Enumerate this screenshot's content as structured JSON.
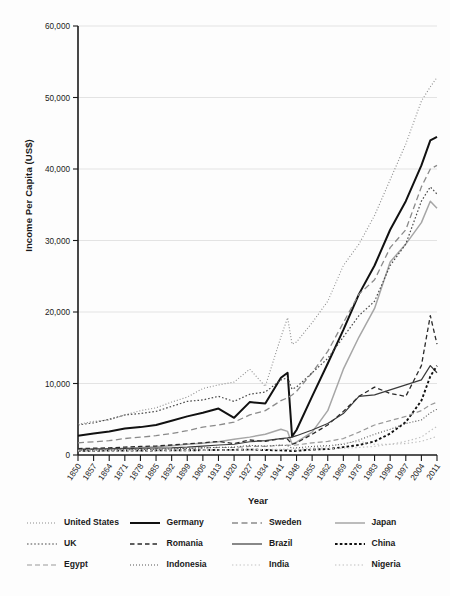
{
  "chart_data": {
    "type": "line",
    "title": "",
    "xlabel": "Year",
    "ylabel": "Income Per Capita (US$)",
    "xlim": [
      1850,
      2011
    ],
    "ylim": [
      0,
      60000
    ],
    "grid": true,
    "legend_position": "bottom",
    "ytick_labels": [
      "0",
      "10,000",
      "20,000",
      "30,000",
      "40,000",
      "50,000",
      "60,000"
    ],
    "ytick_values": [
      0,
      10000,
      20000,
      30000,
      40000,
      50000,
      60000
    ],
    "xtick_labels": [
      "1850",
      "1857",
      "1864",
      "1871",
      "1878",
      "1885",
      "1892",
      "1899",
      "1906",
      "1913",
      "1920",
      "1927",
      "1934",
      "1941",
      "1948",
      "1955",
      "1962",
      "1969",
      "1976",
      "1983",
      "1990",
      "1997",
      "2004",
      "2011"
    ],
    "xtick_values": [
      1850,
      1857,
      1864,
      1871,
      1878,
      1885,
      1892,
      1899,
      1906,
      1913,
      1920,
      1927,
      1934,
      1941,
      1948,
      1955,
      1962,
      1969,
      1976,
      1983,
      1990,
      1997,
      2004,
      2011
    ],
    "x": [
      1850,
      1857,
      1864,
      1871,
      1878,
      1885,
      1892,
      1899,
      1906,
      1913,
      1920,
      1927,
      1934,
      1941,
      1944,
      1946,
      1948,
      1955,
      1962,
      1969,
      1976,
      1983,
      1990,
      1997,
      2004,
      2008,
      2011
    ],
    "series": [
      {
        "name": "United States",
        "style": "dotted-fine",
        "color": "#8c8c8c",
        "width": 1.1,
        "values": [
          4300,
          4700,
          4900,
          5600,
          6200,
          6600,
          7400,
          8100,
          9300,
          9800,
          10200,
          12000,
          9600,
          16500,
          19200,
          15500,
          15800,
          18500,
          21500,
          26500,
          29500,
          33500,
          38500,
          43500,
          49500,
          51500,
          52800
        ]
      },
      {
        "name": "Germany",
        "style": "solid-thick",
        "color": "#111111",
        "width": 2.0,
        "values": [
          2700,
          3000,
          3300,
          3700,
          3900,
          4200,
          4800,
          5400,
          5900,
          6500,
          5200,
          7400,
          7200,
          10800,
          11500,
          2600,
          3500,
          8200,
          12800,
          17500,
          22500,
          26500,
          31500,
          35500,
          40500,
          44000,
          44500
        ]
      },
      {
        "name": "Sweden",
        "style": "dashed-gray",
        "color": "#8a8a8a",
        "width": 1.3,
        "values": [
          1700,
          1850,
          2000,
          2300,
          2500,
          2700,
          3000,
          3400,
          3900,
          4200,
          4600,
          5600,
          6200,
          7600,
          8000,
          8400,
          8900,
          11500,
          14500,
          18500,
          22500,
          24500,
          29000,
          31500,
          37500,
          40000,
          40500
        ]
      },
      {
        "name": "Japan",
        "style": "solid-gray",
        "color": "#a6a6a6",
        "width": 1.5,
        "values": [
          800,
          830,
          880,
          950,
          1050,
          1150,
          1300,
          1500,
          1650,
          1850,
          2200,
          2500,
          2900,
          3600,
          3300,
          1500,
          1800,
          3200,
          6200,
          12000,
          16500,
          20500,
          27000,
          29500,
          32500,
          35500,
          34500
        ]
      },
      {
        "name": "UK",
        "style": "dotted-med",
        "color": "#4a4a4a",
        "width": 1.2,
        "values": [
          4200,
          4500,
          5000,
          5600,
          5800,
          6100,
          6800,
          7500,
          7700,
          8200,
          7500,
          8500,
          8800,
          10500,
          10800,
          9200,
          9500,
          11500,
          13500,
          16500,
          19500,
          21500,
          26500,
          29500,
          35500,
          37500,
          36500
        ]
      },
      {
        "name": "Romania",
        "style": "dashed-dark",
        "color": "#2a2a2a",
        "width": 1.3,
        "values": [
          900,
          950,
          1000,
          1100,
          1200,
          1250,
          1400,
          1550,
          1700,
          1900,
          1600,
          2100,
          1900,
          2300,
          2200,
          1500,
          1700,
          2900,
          4200,
          6100,
          8200,
          9500,
          8600,
          8200,
          12500,
          19500,
          15500
        ]
      },
      {
        "name": "Brazil",
        "style": "solid-thin",
        "color": "#3a3a3a",
        "width": 1.2,
        "values": [
          800,
          820,
          850,
          880,
          920,
          960,
          1000,
          1100,
          1250,
          1400,
          1500,
          1850,
          2000,
          2300,
          2400,
          2500,
          2700,
          3500,
          4400,
          5800,
          8200,
          8400,
          9100,
          9800,
          10500,
          12500,
          11500
        ]
      },
      {
        "name": "China",
        "style": "dotted-bold",
        "color": "#111111",
        "width": 1.9,
        "values": [
          600,
          600,
          610,
          620,
          630,
          640,
          650,
          660,
          680,
          700,
          720,
          760,
          700,
          640,
          620,
          560,
          580,
          760,
          830,
          1100,
          1400,
          1900,
          3000,
          4600,
          7600,
          11000,
          12500
        ]
      },
      {
        "name": "Egypt",
        "style": "dashdot-gray",
        "color": "#9a9a9a",
        "width": 1.2,
        "values": [
          700,
          720,
          740,
          780,
          820,
          860,
          900,
          950,
          1000,
          1050,
          1050,
          1200,
          1200,
          1350,
          1400,
          1350,
          1400,
          1700,
          1900,
          2300,
          3200,
          4200,
          4800,
          5400,
          6200,
          7000,
          7400
        ]
      },
      {
        "name": "Indonesia",
        "style": "dotted-fine",
        "color": "#555555",
        "width": 1.1,
        "values": [
          680,
          690,
          700,
          730,
          760,
          800,
          850,
          920,
          1000,
          1080,
          1100,
          1350,
          1250,
          1400,
          1300,
          950,
          1000,
          1200,
          1300,
          1500,
          2100,
          2900,
          3600,
          4400,
          4900,
          5900,
          6400
        ]
      },
      {
        "name": "India",
        "style": "dotted-light",
        "color": "#c2c2c2",
        "width": 1.2,
        "values": [
          620,
          620,
          630,
          640,
          650,
          660,
          680,
          700,
          710,
          720,
          700,
          780,
          800,
          800,
          780,
          700,
          720,
          800,
          880,
          950,
          1050,
          1200,
          1500,
          1900,
          2500,
          3400,
          4000
        ]
      },
      {
        "name": "Nigeria",
        "style": "dotted-light",
        "color": "#bdbdbd",
        "width": 1.1,
        "values": [
          550,
          555,
          560,
          570,
          580,
          590,
          600,
          620,
          640,
          660,
          680,
          720,
          740,
          780,
          790,
          800,
          820,
          980,
          1150,
          1600,
          1900,
          1500,
          1500,
          1600,
          1900,
          2300,
          2600
        ]
      }
    ]
  },
  "legend": {
    "items": [
      {
        "label": "United States",
        "style": "dotted-fine",
        "color": "#8c8c8c",
        "width": 1.1
      },
      {
        "label": "Germany",
        "style": "solid-thick",
        "color": "#111111",
        "width": 2.0
      },
      {
        "label": "Sweden",
        "style": "dashed-gray",
        "color": "#8a8a8a",
        "width": 1.3
      },
      {
        "label": "Japan",
        "style": "solid-gray",
        "color": "#a6a6a6",
        "width": 1.5
      },
      {
        "label": "UK",
        "style": "dotted-med",
        "color": "#4a4a4a",
        "width": 1.2
      },
      {
        "label": "Romania",
        "style": "dashed-dark",
        "color": "#2a2a2a",
        "width": 1.3
      },
      {
        "label": "Brazil",
        "style": "solid-thin",
        "color": "#3a3a3a",
        "width": 1.2
      },
      {
        "label": "China",
        "style": "dotted-bold",
        "color": "#111111",
        "width": 1.9
      },
      {
        "label": "Egypt",
        "style": "dashdot-gray",
        "color": "#9a9a9a",
        "width": 1.2
      },
      {
        "label": "Indonesia",
        "style": "dotted-fine",
        "color": "#555555",
        "width": 1.1
      },
      {
        "label": "India",
        "style": "dotted-light",
        "color": "#c2c2c2",
        "width": 1.2
      },
      {
        "label": "Nigeria",
        "style": "dotted-light",
        "color": "#bdbdbd",
        "width": 1.1
      }
    ]
  },
  "colors": {
    "grid": "#dcdcdc",
    "axis": "#1a1a1a",
    "background": "#fdfdfd"
  }
}
